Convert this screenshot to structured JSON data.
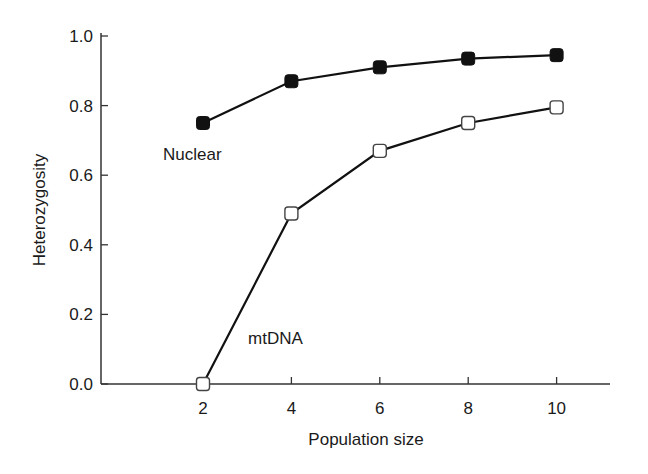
{
  "chart_data": {
    "type": "line",
    "title": "",
    "xlabel": "Population size",
    "ylabel": "Heterozygosity",
    "x": [
      2,
      4,
      6,
      8,
      10
    ],
    "x_ticks": [
      "2",
      "4",
      "6",
      "8",
      "10"
    ],
    "y_ticks": [
      "0.0",
      "0.2",
      "0.4",
      "0.6",
      "0.8",
      "1.0"
    ],
    "xlim": [
      0,
      11
    ],
    "ylim": [
      0,
      1.0
    ],
    "grid": false,
    "legend": "inline labels",
    "series": [
      {
        "name": "Nuclear",
        "marker": "filled-square",
        "values": [
          0.75,
          0.87,
          0.91,
          0.935,
          0.945
        ]
      },
      {
        "name": "mtDNA",
        "marker": "open-square",
        "values": [
          0.0,
          0.49,
          0.67,
          0.75,
          0.795
        ]
      }
    ],
    "annotations": [
      {
        "text": "Nuclear",
        "near_series": "Nuclear",
        "x": 2,
        "position": "below"
      },
      {
        "text": "mtDNA",
        "near_series": "mtDNA",
        "x": 3,
        "position": "right"
      }
    ]
  },
  "colors": {
    "line": "#111111",
    "axis": "#333333",
    "open_marker_fill": "#ffffff"
  }
}
